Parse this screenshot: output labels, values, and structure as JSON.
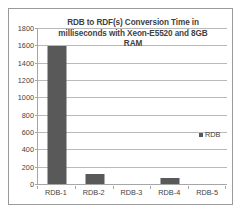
{
  "chart_data": {
    "type": "bar",
    "title": "RDB to RDF(s) Conversion Time in milliseconds with Xeon-E5520 and 8GB RAM",
    "title_lines": [
      "RDB to RDF(s) Conversion Time in",
      "milliseconds with Xeon-E5520 and 8GB",
      "RAM"
    ],
    "categories": [
      "RDB-1",
      "RDB-2",
      "RDB-3",
      "RDB-4",
      "RDB-5"
    ],
    "series": [
      {
        "name": "RDB",
        "values": [
          1590,
          120,
          0,
          75,
          0
        ],
        "color": "#595959"
      }
    ],
    "xlabel": "",
    "ylabel": "",
    "ylim": [
      0,
      1800
    ],
    "yticks": [
      0,
      200,
      400,
      600,
      800,
      1000,
      1200,
      1400,
      1600,
      1800
    ],
    "ytick_labels": [
      "0",
      "200",
      "400",
      "600",
      "800",
      "1000",
      "1200",
      "1400",
      "1600",
      "1800"
    ],
    "grid": true,
    "grid_axis": "y",
    "legend": {
      "entries": [
        "RDB"
      ],
      "position": "center-right"
    },
    "colors": {
      "bar": "#595959",
      "gridline": "#b9b9b9",
      "axis": "#a6a6a6",
      "text": "#3f3f3f",
      "background": "#ffffff",
      "border": "#9a9a9a"
    }
  }
}
